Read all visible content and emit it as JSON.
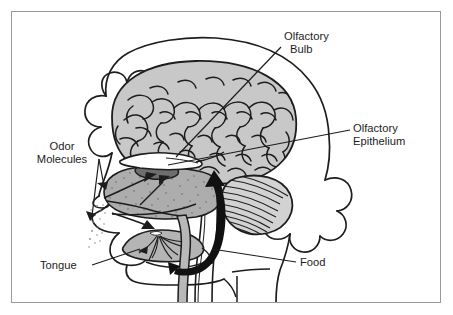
{
  "figure": {
    "type": "anatomical-diagram",
    "frame": {
      "border_color": "#9a9a9a",
      "background": "#ffffff"
    }
  },
  "palette": {
    "outline": "#1d1d1d",
    "brain_fill": "#c8c8c8",
    "cerebellum_fill": "#d2d2d2",
    "nasal_fill": "#adadad",
    "epithelium_fill": "#6e6e6e",
    "bulb_fill": "#ffffff",
    "tongue_fill": "#b4b4b4",
    "throat_fill": "#b8b8b8",
    "arrow_fill": "#111111",
    "label_text": "#1d1d1d",
    "odor_dot": "#8d8d8d"
  },
  "labels": [
    {
      "id": "olfactory-bulb",
      "lines": [
        "Olfactory",
        "Bulb"
      ],
      "line1": "Olfactory",
      "line2": "Bulb",
      "x": 284,
      "y": 40,
      "anchor": "start",
      "leader": {
        "from_x": 281,
        "from_y": 47,
        "to_x": 176,
        "to_y": 157
      }
    },
    {
      "id": "olfactory-epithelium",
      "lines": [
        "Olfactory",
        "Epithelium"
      ],
      "line1": "Olfactory",
      "line2": "Epithelium",
      "x": 353,
      "y": 132,
      "anchor": "start",
      "leader": {
        "from_x": 350,
        "from_y": 130,
        "to_x": 168,
        "to_y": 165
      }
    },
    {
      "id": "odor-molecules",
      "lines": [
        "Odor",
        "Molecules"
      ],
      "line1": "Odor",
      "line2": "Molecules",
      "x": 67,
      "y": 150,
      "anchor": "middle",
      "leader": {
        "from_x": 99,
        "from_y": 159,
        "to_x": 100,
        "to_y": 196
      }
    },
    {
      "id": "tongue",
      "lines": [
        "Tongue"
      ],
      "line1": "Tongue",
      "line2": "",
      "x": 40,
      "y": 269,
      "anchor": "start",
      "leader": {
        "from_x": 92,
        "from_y": 265,
        "to_x": 140,
        "to_y": 249
      }
    },
    {
      "id": "food",
      "lines": [
        "Food"
      ],
      "line1": "Food",
      "line2": "",
      "x": 300,
      "y": 266,
      "anchor": "start",
      "leader": {
        "from_x": 296,
        "from_y": 262,
        "to_x": 212,
        "to_y": 249
      }
    }
  ],
  "structures": [
    {
      "id": "head-outline",
      "name": "Head and hair outline"
    },
    {
      "id": "cerebrum",
      "name": "Cerebrum"
    },
    {
      "id": "cerebellum",
      "name": "Cerebellum"
    },
    {
      "id": "brainstem",
      "name": "Brainstem"
    },
    {
      "id": "olfactory-bulb-shape",
      "name": "Olfactory bulb"
    },
    {
      "id": "olfactory-epithelium-shape",
      "name": "Olfactory epithelium"
    },
    {
      "id": "nasal-cavity",
      "name": "Nasal cavity"
    },
    {
      "id": "tongue-shape",
      "name": "Tongue"
    },
    {
      "id": "throat-passage",
      "name": "Throat and esophagus"
    },
    {
      "id": "odor-molecule-dots",
      "name": "Odor molecules"
    },
    {
      "id": "food-arrow",
      "name": "Retronasal airflow arrow"
    },
    {
      "id": "odor-inflow-arrow",
      "name": "Orthonasal airflow arrow"
    }
  ]
}
